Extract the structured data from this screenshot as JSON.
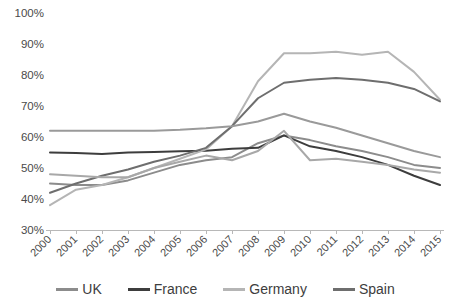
{
  "chart_data": {
    "type": "line",
    "title": "",
    "xlabel": "",
    "ylabel": "",
    "categories": [
      "2000",
      "2001",
      "2002",
      "2003",
      "2004",
      "2005",
      "2006",
      "2007",
      "2008",
      "2009",
      "2010",
      "2011",
      "2012",
      "2013",
      "2014",
      "2015"
    ],
    "ylim": [
      30,
      100
    ],
    "yticks": [
      "30%",
      "40%",
      "50%",
      "60%",
      "70%",
      "80%",
      "90%",
      "100%"
    ],
    "ytick_values": [
      30,
      40,
      50,
      60,
      70,
      80,
      90,
      100
    ],
    "grid": false,
    "legend_position": "bottom",
    "y_unit": "%",
    "series": [
      {
        "name": "UK",
        "color": "#8c8c8c",
        "values": [
          45,
          44.5,
          44.5,
          46,
          48.5,
          51,
          52.5,
          53.5,
          58,
          60.5,
          59,
          57,
          55.5,
          53.5,
          51,
          50
        ]
      },
      {
        "name": "France",
        "color": "#3d3d3d",
        "values": [
          55,
          54.8,
          54.5,
          55,
          55.2,
          55.4,
          55.6,
          56.2,
          56.5,
          60.5,
          57,
          55.5,
          53.5,
          51,
          47.5,
          44.5
        ]
      },
      {
        "name": "Germany",
        "color": "#b5b5b5",
        "values": [
          38,
          43,
          44.5,
          47,
          50,
          53,
          56,
          63.5,
          78,
          87,
          87,
          87.5,
          86.5,
          87.5,
          81,
          72
        ]
      },
      {
        "name": "Spain",
        "color": "#6e6e6e",
        "values": [
          42,
          45,
          47.5,
          49.5,
          52,
          54,
          56.5,
          63.5,
          72.5,
          77.5,
          78.5,
          79,
          78.5,
          77.5,
          75.5,
          71.5
        ]
      },
      {
        "name": "series-5",
        "color": "#9a9a9a",
        "values": [
          62,
          62,
          62,
          62,
          62,
          62.3,
          62.8,
          63.5,
          65,
          67.5,
          65,
          63,
          60.5,
          58,
          55.5,
          53.5
        ]
      },
      {
        "name": "series-6",
        "color": "#a8a8a8",
        "values": [
          48,
          47.5,
          47,
          47,
          50,
          52,
          54,
          52.5,
          55.5,
          62,
          52.5,
          53,
          52,
          51,
          49.5,
          48.5
        ]
      }
    ]
  },
  "legend": {
    "items": [
      {
        "label": "UK",
        "color": "#8c8c8c"
      },
      {
        "label": "France",
        "color": "#3d3d3d"
      },
      {
        "label": "Germany",
        "color": "#b5b5b5"
      },
      {
        "label": "Spain",
        "color": "#6e6e6e"
      }
    ]
  },
  "axes": {
    "y_labels": [
      "100%",
      "90%",
      "80%",
      "70%",
      "60%",
      "50%",
      "40%",
      "30%"
    ],
    "x_labels": [
      "2000",
      "2001",
      "2002",
      "2003",
      "2004",
      "2005",
      "2006",
      "2007",
      "2008",
      "2009",
      "2010",
      "2011",
      "2012",
      "2013",
      "2014",
      "2015"
    ]
  }
}
